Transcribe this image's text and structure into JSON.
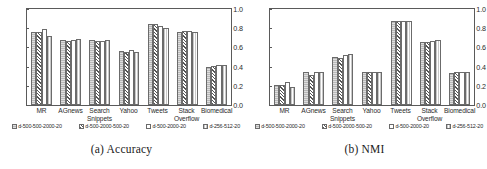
{
  "figure": {
    "panels": [
      {
        "caption": "(a) Accuracy",
        "chart_data": {
          "type": "bar",
          "title": "(a) Accuracy",
          "xlabel": "",
          "ylabel": "",
          "ylim": [
            0.0,
            1.0
          ],
          "yticks": [
            "0.0",
            "0.2",
            "0.4",
            "0.6",
            "0.8",
            "1.0"
          ],
          "grid": false,
          "legend_position": "below",
          "categories": [
            "MR",
            "AGnews",
            "Search Snippets",
            "Yahoo",
            "Tweets",
            "Stack Overflow",
            "Biomedical"
          ],
          "series": [
            {
              "name": "d-500-500-2000-20",
              "values": [
                0.76,
                0.68,
                0.68,
                0.56,
                0.84,
                0.76,
                0.4
              ]
            },
            {
              "name": "d-500-2000-500-20",
              "values": [
                0.76,
                0.67,
                0.67,
                0.55,
                0.84,
                0.77,
                0.41
              ]
            },
            {
              "name": "d-500-2000-20",
              "values": [
                0.79,
                0.68,
                0.67,
                0.57,
                0.82,
                0.77,
                0.42
              ]
            },
            {
              "name": "d-256-512-20",
              "values": [
                0.72,
                0.69,
                0.68,
                0.55,
                0.8,
                0.76,
                0.42
              ]
            }
          ]
        }
      },
      {
        "caption": "(b) NMI",
        "chart_data": {
          "type": "bar",
          "title": "(b) NMI",
          "xlabel": "",
          "ylabel": "",
          "ylim": [
            0.0,
            1.0
          ],
          "yticks": [
            "0.0",
            "0.2",
            "0.4",
            "0.6",
            "0.8",
            "1.0"
          ],
          "grid": false,
          "legend_position": "below",
          "categories": [
            "MR",
            "AGnews",
            "Search Snippets",
            "Yahoo",
            "Tweets",
            "Stack Overflow",
            "Biomedical"
          ],
          "series": [
            {
              "name": "d-500-500-2000-20",
              "values": [
                0.21,
                0.34,
                0.5,
                0.34,
                0.88,
                0.66,
                0.33
              ]
            },
            {
              "name": "d-500-2000-500-20",
              "values": [
                0.21,
                0.31,
                0.49,
                0.34,
                0.88,
                0.66,
                0.34
              ]
            },
            {
              "name": "d-500-2000-20",
              "values": [
                0.24,
                0.34,
                0.52,
                0.34,
                0.88,
                0.67,
                0.34
              ]
            },
            {
              "name": "d-256-512-20",
              "values": [
                0.185,
                0.34,
                0.53,
                0.345,
                0.88,
                0.68,
                0.345
              ]
            }
          ]
        }
      }
    ]
  }
}
